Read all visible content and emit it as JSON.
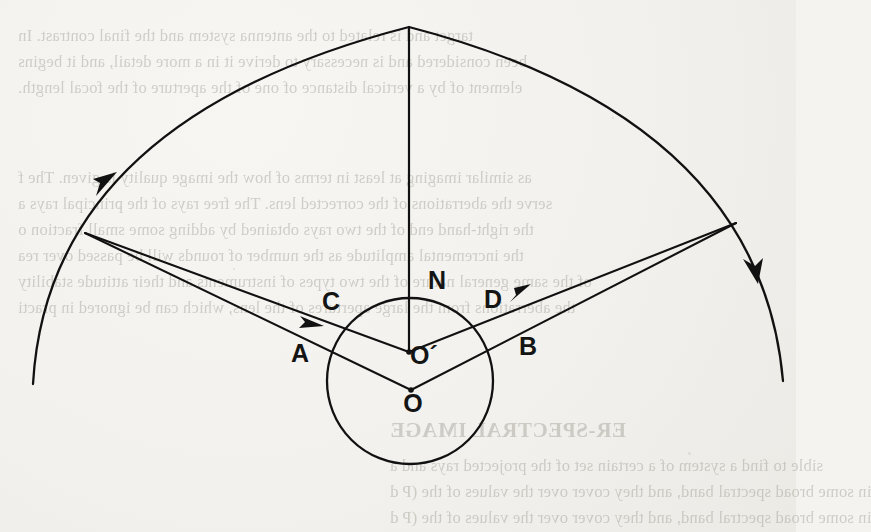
{
  "page": {
    "kind": "scanned-book-page",
    "background_color": "#f2f1ed",
    "ink_color": "#111111",
    "bleed_text_color": "#9c988f"
  },
  "bleed_text": {
    "note": "faint mirrored show-through text from the reverse side of the printed sheet",
    "top_block": [
      "target and is related to the antenna system and the final contrast. In",
      "been considered and is necessary to derive it in a more detail, and it begins",
      "element of by a vertical distance of one of the aperture of the focal length."
    ],
    "middle_block": [
      "as similar imaging at least in terms of how the image quality is given. The f",
      "serve the aberrations of the corrected lens. The free rays of the principal rays a",
      "the right-hand end of the two rays obtained by adding some small fraction o",
      "the incremental amplitude as the number of rounds will be passed over rea",
      "of the same general nature of the two types of instruments and their attitude stability",
      "the aberrations from the large apertures of the lens, which can be ignored in practi"
    ],
    "bottom_heading": "ER-SPECTRAL IMAGE",
    "bottom_block": [
      "sible to find a system of a certain set of the projected rays and a",
      "in some broad spectral band, and they cover over the values of the (P d",
      "in some broad spectral band, and they cover over the values of the (P d"
    ]
  },
  "figure": {
    "type": "geometric-optics-astronomy-diagram",
    "labels": [
      {
        "id": "N",
        "text": "N",
        "x": 437,
        "y": 289
      },
      {
        "id": "C",
        "text": "C",
        "x": 331,
        "y": 310
      },
      {
        "id": "D",
        "text": "D",
        "x": 493,
        "y": 308
      },
      {
        "id": "A",
        "text": "A",
        "x": 300,
        "y": 362
      },
      {
        "id": "B",
        "text": "B",
        "x": 528,
        "y": 355
      },
      {
        "id": "Op",
        "text": "O´",
        "x": 424,
        "y": 364
      },
      {
        "id": "O",
        "text": "O",
        "x": 413,
        "y": 412
      }
    ],
    "big_arc": {
      "apex_x": 409,
      "apex_y": 27,
      "left_end_x": 33,
      "left_end_y": 384,
      "right_end_x": 783,
      "right_end_y": 381,
      "stroke_width": 2.2
    },
    "small_circle": {
      "cx": 410,
      "cy": 381,
      "r": 83,
      "stroke_width": 2.2
    },
    "zenith_line": {
      "x": 409,
      "y_top": 27,
      "y_bottom": 352
    },
    "vertices": {
      "left_source_x": 85,
      "left_source_y": 233,
      "right_source_x": 736,
      "right_source_y": 223,
      "o_prime_x": 409,
      "o_prime_y": 352,
      "o_x": 411,
      "o_y": 390
    },
    "arc_arrowheads": [
      {
        "id": "left-arc-arrow",
        "x": 106,
        "y": 184,
        "direction": "up-right-along-arc"
      },
      {
        "id": "right-arc-arrow",
        "x": 756,
        "y": 268,
        "direction": "down-along-arc"
      }
    ],
    "ray_arrowheads": [
      {
        "id": "ray-arrow-toward-C",
        "x": 311,
        "y": 321,
        "direction": "right-down"
      },
      {
        "id": "ray-arrow-from-D",
        "x": 521,
        "y": 293,
        "direction": "up-right"
      }
    ],
    "rays": [
      {
        "id": "left-upper-ray",
        "from": "left_source",
        "to": "o_prime",
        "through": "C"
      },
      {
        "id": "left-lower-ray",
        "from": "left_source",
        "to": "o",
        "through": "A"
      },
      {
        "id": "right-upper-ray",
        "from": "right_source",
        "to": "o_prime",
        "through": "D"
      },
      {
        "id": "right-lower-ray",
        "from": "right_source",
        "to": "o",
        "through": "B"
      }
    ]
  }
}
